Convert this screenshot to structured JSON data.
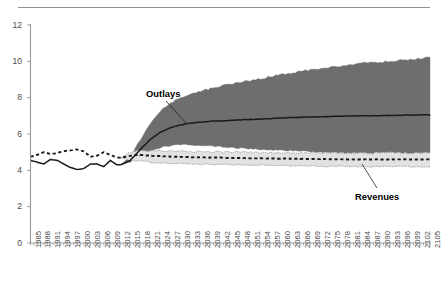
{
  "figure": {
    "top_rule": true,
    "background": "#ffffff",
    "axis_color": "#9a9a9a",
    "tick_label_color": "#4a4a4a"
  },
  "annotations": [
    {
      "name": "outlays-label",
      "text": "Outlays",
      "x": 146,
      "y": 88,
      "leader": {
        "x1": 166,
        "y1": 101,
        "x2": 186,
        "y2": 123
      }
    },
    {
      "name": "revenues-label",
      "text": "Revenues",
      "x": 355,
      "y": 191,
      "leader": {
        "x1": 377,
        "y1": 188,
        "x2": 362,
        "y2": 164
      }
    }
  ],
  "chart_data": {
    "type": "area",
    "title": "",
    "subtitle": "",
    "xlabel": "",
    "ylabel": "",
    "grid": false,
    "legend": "annotated-inline",
    "xlim": [
      1985,
      2105
    ],
    "ylim": [
      0,
      12
    ],
    "yticks": [
      0,
      2,
      4,
      6,
      8,
      10,
      12
    ],
    "ytick_labels": [
      "0",
      "2",
      "4",
      "6",
      "8",
      "10",
      "12"
    ],
    "xticks": [
      1985,
      1988,
      1991,
      1994,
      1997,
      2000,
      2003,
      2006,
      2009,
      2012,
      2015,
      2018,
      2021,
      2024,
      2027,
      2030,
      2033,
      2036,
      2039,
      2042,
      2045,
      2048,
      2051,
      2054,
      2057,
      2060,
      2063,
      2066,
      2069,
      2072,
      2075,
      2078,
      2081,
      2084,
      2087,
      2090,
      2093,
      2096,
      2099,
      2102,
      2105
    ],
    "xtick_labels": [
      "1985",
      "1988",
      "1991",
      "1994",
      "1997",
      "2000",
      "2003",
      "2006",
      "2009",
      "2012",
      "2015",
      "2018",
      "2021",
      "2024",
      "2027",
      "2030",
      "2033",
      "2036",
      "2039",
      "2042",
      "2045",
      "2048",
      "2051",
      "2054",
      "2057",
      "2060",
      "2063",
      "2066",
      "2069",
      "2072",
      "2075",
      "2078",
      "2081",
      "2084",
      "2087",
      "2090",
      "2093",
      "2096",
      "2099",
      "2102",
      "2105"
    ],
    "xtick_minor_every": 1,
    "projection_start": 2012,
    "colors": {
      "outlays_band": "#6e6e6e",
      "outlays_line": "#1a1a1a",
      "revenues_band": "#e2e2e2",
      "revenues_line": "#1a1a1a"
    },
    "series": [
      {
        "name": "Outlays",
        "style": "solid",
        "band": "outlays_band",
        "x": [
          1985,
          1987,
          1989,
          1991,
          1993,
          1995,
          1997,
          1999,
          2001,
          2003,
          2005,
          2007,
          2009,
          2011,
          2012,
          2015,
          2018,
          2021,
          2024,
          2027,
          2030,
          2033,
          2036,
          2039,
          2042,
          2045,
          2048,
          2051,
          2054,
          2057,
          2060,
          2063,
          2066,
          2069,
          2072,
          2075,
          2078,
          2081,
          2084,
          2087,
          2090,
          2093,
          2096,
          2099,
          2102,
          2105
        ],
        "values": [
          4.55,
          4.45,
          4.35,
          4.6,
          4.55,
          4.35,
          4.15,
          4.05,
          4.1,
          4.35,
          4.35,
          4.2,
          4.55,
          4.3,
          4.3,
          4.55,
          5.15,
          5.7,
          6.1,
          6.35,
          6.5,
          6.6,
          6.65,
          6.7,
          6.72,
          6.75,
          6.78,
          6.8,
          6.82,
          6.85,
          6.88,
          6.9,
          6.92,
          6.94,
          6.95,
          6.96,
          6.98,
          6.99,
          7.0,
          7.0,
          7.01,
          7.02,
          7.03,
          7.04,
          7.05,
          7.05
        ],
        "band_lower": [
          null,
          null,
          null,
          null,
          null,
          null,
          null,
          null,
          null,
          null,
          null,
          null,
          null,
          null,
          4.3,
          4.45,
          4.75,
          5.05,
          5.25,
          5.35,
          5.4,
          5.4,
          5.38,
          5.35,
          5.3,
          5.25,
          5.22,
          5.18,
          5.15,
          5.12,
          5.1,
          5.08,
          5.05,
          5.02,
          5.0,
          4.98,
          4.96,
          4.95,
          4.94,
          4.93,
          4.92,
          4.92,
          4.91,
          4.9,
          4.9,
          4.9
        ],
        "band_upper": [
          null,
          null,
          null,
          null,
          null,
          null,
          null,
          null,
          null,
          null,
          null,
          null,
          null,
          null,
          4.3,
          4.75,
          5.7,
          6.6,
          7.25,
          7.7,
          8.0,
          8.2,
          8.35,
          8.5,
          8.62,
          8.75,
          8.85,
          8.95,
          9.05,
          9.15,
          9.25,
          9.35,
          9.45,
          9.52,
          9.6,
          9.68,
          9.75,
          9.82,
          9.88,
          9.92,
          9.96,
          10.0,
          10.05,
          10.1,
          10.15,
          10.2
        ]
      },
      {
        "name": "Revenues",
        "style": "dashed",
        "band": "revenues_band",
        "x": [
          1985,
          1987,
          1989,
          1991,
          1993,
          1995,
          1997,
          1999,
          2001,
          2003,
          2005,
          2007,
          2009,
          2011,
          2012,
          2015,
          2018,
          2021,
          2024,
          2027,
          2030,
          2033,
          2036,
          2039,
          2042,
          2045,
          2048,
          2051,
          2054,
          2057,
          2060,
          2063,
          2066,
          2069,
          2072,
          2075,
          2078,
          2081,
          2084,
          2087,
          2090,
          2093,
          2096,
          2099,
          2102,
          2105
        ],
        "values": [
          4.75,
          4.85,
          5.0,
          4.9,
          4.95,
          5.05,
          5.1,
          5.15,
          5.05,
          4.75,
          4.8,
          5.0,
          4.85,
          4.7,
          4.7,
          4.8,
          4.85,
          4.8,
          4.78,
          4.76,
          4.74,
          4.72,
          4.72,
          4.7,
          4.7,
          4.68,
          4.68,
          4.66,
          4.66,
          4.65,
          4.64,
          4.64,
          4.63,
          4.62,
          4.62,
          4.61,
          4.61,
          4.6,
          4.6,
          4.6,
          4.6,
          4.6,
          4.6,
          4.6,
          4.6,
          4.6
        ],
        "band_lower": [
          null,
          null,
          null,
          null,
          null,
          null,
          null,
          null,
          null,
          null,
          null,
          null,
          null,
          null,
          4.7,
          4.55,
          4.5,
          4.45,
          4.42,
          4.4,
          4.38,
          4.36,
          4.35,
          4.34,
          4.32,
          4.31,
          4.3,
          4.29,
          4.28,
          4.27,
          4.26,
          4.25,
          4.24,
          4.24,
          4.23,
          4.22,
          4.22,
          4.21,
          4.21,
          4.2,
          4.2,
          4.2,
          4.2,
          4.2,
          4.2,
          4.2
        ],
        "band_upper": [
          null,
          null,
          null,
          null,
          null,
          null,
          null,
          null,
          null,
          null,
          null,
          null,
          null,
          null,
          4.7,
          5.0,
          5.1,
          5.08,
          5.06,
          5.05,
          5.04,
          5.03,
          5.02,
          5.01,
          5.0,
          5.0,
          4.99,
          4.99,
          4.98,
          4.98,
          4.97,
          4.97,
          4.96,
          4.96,
          4.96,
          4.95,
          4.95,
          4.95,
          4.95,
          4.95,
          4.95,
          4.95,
          4.95,
          4.95,
          4.95,
          4.95
        ]
      }
    ]
  }
}
